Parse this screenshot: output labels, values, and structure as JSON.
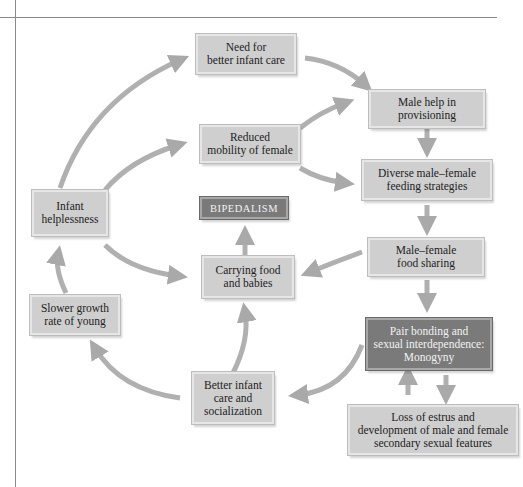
{
  "diagram": {
    "title": "",
    "nodes": [
      {
        "id": "need-infant-care",
        "label": "Need for\nbetter infant care"
      },
      {
        "id": "male-help",
        "label": "Male help in\nprovisioning"
      },
      {
        "id": "reduced-mobility",
        "label": "Reduced\nmobility of female"
      },
      {
        "id": "diverse-feeding",
        "label": "Diverse male–female\nfeeding strategies"
      },
      {
        "id": "infant-helplessness",
        "label": "Infant\nhelplessness"
      },
      {
        "id": "bipedalism",
        "label": "BIPEDALISM"
      },
      {
        "id": "food-sharing",
        "label": "Male–female\nfood sharing"
      },
      {
        "id": "carrying",
        "label": "Carrying food\nand babies"
      },
      {
        "id": "slower-growth",
        "label": "Slower growth\nrate of young"
      },
      {
        "id": "pair-bonding",
        "label": "Pair bonding and\nsexual interdependence:\nMonogyny"
      },
      {
        "id": "better-care",
        "label": "Better infant\ncare and\nsocialization"
      },
      {
        "id": "loss-estrus",
        "label": "Loss of estrus and\ndevelopment of male and female\nsecondary sexual features"
      }
    ],
    "edges": [
      {
        "from": "infant-helplessness",
        "to": "need-infant-care"
      },
      {
        "from": "need-infant-care",
        "to": "male-help"
      },
      {
        "from": "infant-helplessness",
        "to": "reduced-mobility"
      },
      {
        "from": "reduced-mobility",
        "to": "male-help"
      },
      {
        "from": "reduced-mobility",
        "to": "diverse-feeding"
      },
      {
        "from": "male-help",
        "to": "diverse-feeding"
      },
      {
        "from": "diverse-feeding",
        "to": "food-sharing"
      },
      {
        "from": "infant-helplessness",
        "to": "carrying"
      },
      {
        "from": "food-sharing",
        "to": "carrying"
      },
      {
        "from": "carrying",
        "to": "bipedalism"
      },
      {
        "from": "food-sharing",
        "to": "pair-bonding"
      },
      {
        "from": "pair-bonding",
        "to": "better-care"
      },
      {
        "from": "better-care",
        "to": "carrying"
      },
      {
        "from": "better-care",
        "to": "slower-growth"
      },
      {
        "from": "slower-growth",
        "to": "infant-helplessness"
      },
      {
        "from": "pair-bonding",
        "to": "loss-estrus"
      },
      {
        "from": "loss-estrus",
        "to": "pair-bonding"
      }
    ]
  },
  "colors": {
    "box_light": "#cfcfcf",
    "box_dark": "#7a7a7a",
    "arrow": "#a9a9a9"
  }
}
